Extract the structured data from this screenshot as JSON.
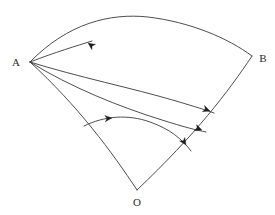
{
  "figure": {
    "width": 275,
    "height": 215,
    "background_color": "#ffffff",
    "stroke_color": "#3a3a3a",
    "arrow_color": "#1d1d1d",
    "label_color": "#2b2b2b"
  },
  "labels": {
    "vertex_o": "O",
    "vertex_a": "A",
    "vertex_b": "B"
  },
  "points": {
    "o": {
      "name": "O",
      "x": 137,
      "y": 190,
      "label_x": 137,
      "label_y": 202
    },
    "a": {
      "name": "A",
      "x": 30,
      "y": 62,
      "label_x": 16,
      "label_y": 62
    },
    "b": {
      "name": "B",
      "x": 252,
      "y": 56,
      "label_x": 263,
      "label_y": 58
    }
  },
  "curves": {
    "outer_arc_ab": "M 30,62 C 68,23 110,13 148,17 C 190,22 228,38 252,56",
    "radius_oa": "M 137,190 C 112,152 78,106 30,62",
    "radius_ob": "M 252,56 C 228,92 196,134 137,190",
    "geodesic_upper": "M 30,62 C 78,77 132,88 176,101 C 196,107 206,110 214,113",
    "geodesic_lower": "M 30,62 C 70,87 120,107 162,120 C 184,127 196,130 206,132",
    "inner_arc": "M 84,126 C 104,116 128,114 150,122 C 170,129 182,139 191,151"
  },
  "arrowheads": [
    {
      "id": "arrow-upper-curve-to-a",
      "x": 88,
      "y": 43,
      "angle": 215,
      "size": 7
    },
    {
      "id": "arrow-geodesic-upper-end",
      "x": 210,
      "y": 111,
      "angle": 20,
      "size": 7
    },
    {
      "id": "arrow-geodesic-lower-end",
      "x": 202,
      "y": 130,
      "angle": 20,
      "size": 7
    },
    {
      "id": "arrow-inner-arc-mid",
      "x": 112,
      "y": 118,
      "angle": 355,
      "size": 7
    },
    {
      "id": "arrow-inner-arc-end",
      "x": 186,
      "y": 145,
      "angle": 57,
      "size": 7
    }
  ],
  "extra_segments": {
    "upper_ray_from_a": "M 30,62 C 56,52 76,46 92,41"
  }
}
